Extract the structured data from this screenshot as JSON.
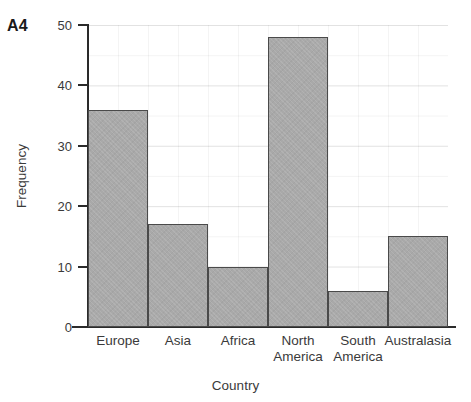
{
  "figure": {
    "label": "A4"
  },
  "chart_data": {
    "type": "bar",
    "title": "",
    "xlabel": "Country",
    "ylabel": "Frequency",
    "categories": [
      "Europe",
      "Asia",
      "Africa",
      "North\nAmerica",
      "South\nAmerica",
      "Australasia"
    ],
    "values": [
      36,
      17,
      10,
      48,
      6,
      15
    ],
    "ylim": [
      0,
      50
    ],
    "yticks": [
      0,
      10,
      20,
      30,
      40,
      50
    ],
    "ytick_labels": [
      "0",
      "10",
      "20",
      "30",
      "40",
      "50"
    ],
    "grid": true,
    "legend": null,
    "bar_fill_color": "#a9a9a9",
    "bar_edge_color": "#4a4a4a",
    "axis_color": "#2b2b2b"
  }
}
